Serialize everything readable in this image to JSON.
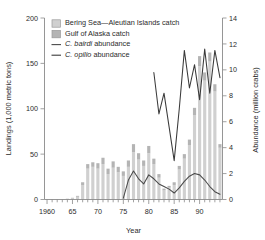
{
  "chart_data": {
    "type": "bar",
    "title": "",
    "xlabel": "Year",
    "ylabel": "Landings (1,000 metric tons)",
    "y2label": "Abundance (million crabs)",
    "xlim": [
      1959.5,
      1994.5
    ],
    "ylim": [
      0,
      200
    ],
    "y2lim": [
      0,
      14
    ],
    "grid": false,
    "legend_position": "top-left-inside",
    "xticks": [
      1960,
      1965,
      1970,
      1975,
      1980,
      1985,
      1990
    ],
    "xticklabels": [
      "1960",
      "65",
      "70",
      "75",
      "80",
      "85",
      "90"
    ],
    "yticks": [
      0,
      50,
      100,
      150,
      200
    ],
    "yticklabels": [
      "0",
      "50",
      "100",
      "150",
      "200"
    ],
    "y2ticks": [
      0,
      2,
      4,
      6,
      8,
      10,
      12,
      14
    ],
    "y2ticklabels": [
      "0",
      "2",
      "4",
      "6",
      "8",
      "10",
      "12",
      "14"
    ],
    "x": [
      1960,
      1961,
      1962,
      1963,
      1964,
      1965,
      1966,
      1967,
      1968,
      1969,
      1970,
      1971,
      1972,
      1973,
      1974,
      1975,
      1976,
      1977,
      1978,
      1979,
      1980,
      1981,
      1982,
      1983,
      1984,
      1985,
      1986,
      1987,
      1988,
      1989,
      1990,
      1991,
      1992,
      1993,
      1994
    ],
    "series": [
      {
        "name": "Bering Sea—Aleutian Islands catch",
        "type": "bar-stack",
        "color": "#d0d0d0",
        "unit": "1,000 metric tons",
        "axis": "left",
        "values": [
          0,
          0,
          0,
          0,
          1,
          2,
          3,
          16,
          34,
          36,
          34,
          39,
          28,
          35,
          30,
          26,
          36,
          52,
          44,
          37,
          51,
          39,
          24,
          10,
          13,
          16,
          33,
          45,
          60,
          93,
          147,
          131,
          152,
          119,
          57
        ]
      },
      {
        "name": "Gulf of Alaska catch",
        "type": "bar-stack",
        "color": "#b4b4b4",
        "unit": "1,000 metric tons",
        "axis": "left",
        "values": [
          0,
          0,
          0,
          0,
          0,
          0,
          1,
          3,
          5,
          5,
          6,
          7,
          6,
          7,
          6,
          5,
          7,
          9,
          7,
          6,
          8,
          6,
          4,
          2,
          2,
          3,
          4,
          5,
          6,
          8,
          11,
          9,
          10,
          8,
          4
        ]
      },
      {
        "name": "C. bairdi abundance",
        "type": "line",
        "color": "#4a4a4a",
        "unit": "million crabs",
        "axis": "right",
        "values": [
          null,
          null,
          null,
          null,
          null,
          null,
          null,
          null,
          null,
          null,
          null,
          null,
          null,
          null,
          null,
          0.1,
          1.5,
          2.2,
          1.6,
          1.2,
          1.9,
          1.6,
          1.2,
          1.0,
          0.8,
          0.5,
          0.9,
          1.4,
          1.8,
          2.0,
          1.9,
          1.5,
          1.0,
          0.6,
          0.4
        ]
      },
      {
        "name": "C. opilio abundance",
        "type": "line",
        "color": "#3a3a3a",
        "unit": "million crabs",
        "axis": "right",
        "values": [
          null,
          null,
          null,
          null,
          null,
          null,
          null,
          null,
          null,
          null,
          null,
          null,
          null,
          null,
          null,
          null,
          null,
          null,
          null,
          null,
          null,
          9.8,
          6.6,
          8.2,
          5.6,
          3.0,
          7.0,
          11.5,
          8.6,
          10.4,
          7.7,
          11.6,
          8.2,
          11.5,
          9.4
        ]
      }
    ],
    "legend": [
      {
        "label": "Bering Sea—Aleutian Islands catch",
        "marker": "swatch",
        "color": "#d0d0d0"
      },
      {
        "label": "Gulf of Alaska catch",
        "marker": "swatch",
        "color": "#b4b4b4"
      },
      {
        "label": "C. bairdi abundance",
        "marker": "line",
        "color": "#4a4a4a",
        "italic_part": "C. bairdi",
        "plain_part": " abundance"
      },
      {
        "label": "C. opilio abundance",
        "marker": "line",
        "color": "#3a3a3a",
        "italic_part": "C. opilio",
        "plain_part": " abundance"
      }
    ]
  }
}
